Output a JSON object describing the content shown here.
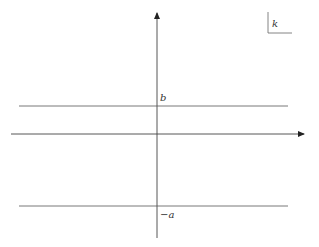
{
  "diagram": {
    "type": "complex-plane-strip",
    "corner_label": "k",
    "axes": {
      "x_axis": {
        "arrow": "right"
      },
      "y_axis": {
        "arrow": "up"
      }
    },
    "horizontal_lines": [
      {
        "name": "upper-line",
        "label": "b"
      },
      {
        "name": "lower-line",
        "label": "−a"
      }
    ],
    "colors": {
      "line": "#444444",
      "text": "#333333",
      "background": "#ffffff"
    }
  }
}
